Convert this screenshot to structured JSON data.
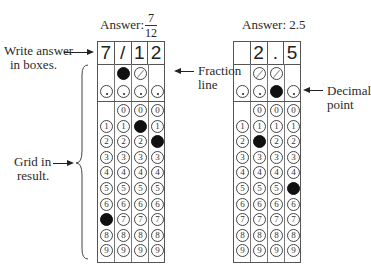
{
  "left_panel": {
    "answer_label": "Answer:",
    "fraction": {
      "numerator": "7",
      "denominator": "12"
    },
    "entries": [
      "7",
      "/",
      "1",
      "2"
    ],
    "filled": {
      "slash_col": 1,
      "dot_col": null,
      "digits": [
        [
          0,
          7
        ],
        [
          2,
          1
        ],
        [
          3,
          2
        ]
      ]
    },
    "slash_cols": [
      1,
      2
    ],
    "digit_start": [
      1,
      0,
      0,
      0
    ]
  },
  "right_panel": {
    "answer_label": "Answer: 2.5",
    "entries": [
      "",
      "2",
      ".",
      "5"
    ],
    "filled": {
      "slash_col": null,
      "dot_col": 2,
      "digits": [
        [
          1,
          2
        ],
        [
          3,
          5
        ]
      ]
    },
    "slash_cols": [
      1,
      2
    ],
    "digit_start": [
      1,
      0,
      0,
      0
    ]
  },
  "annotations": {
    "write_answer": "Write answer\nin boxes.",
    "write_answer_line1": "Write answer",
    "write_answer_line2": "in boxes.",
    "grid_in_line1": "Grid in",
    "grid_in_line2": "result.",
    "fraction_line1": "Fraction",
    "fraction_line2": "line",
    "decimal_line1": "Decimal",
    "decimal_line2": "point"
  },
  "digits": [
    "0",
    "1",
    "2",
    "3",
    "4",
    "5",
    "6",
    "7",
    "8",
    "9"
  ]
}
